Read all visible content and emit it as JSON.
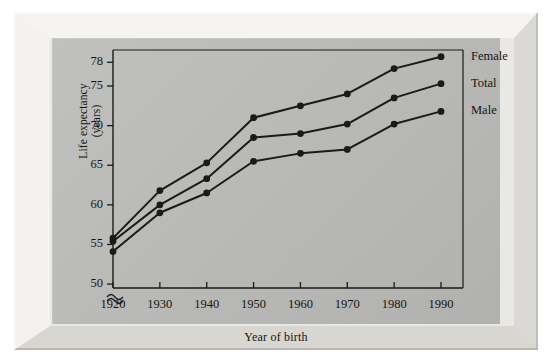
{
  "chart_data": {
    "type": "line",
    "title": "",
    "xlabel": "Year of birth",
    "ylabel": "Life expectancy (years)",
    "ylabel_line1": "Life expectancy",
    "ylabel_line2": "(years)",
    "x": [
      1920,
      1930,
      1940,
      1950,
      1960,
      1970,
      1980,
      1990
    ],
    "xtick_labels": [
      "1920",
      "1930",
      "1940",
      "1950",
      "1960",
      "1970",
      "1980",
      "1990"
    ],
    "ytick_labels": [
      "50",
      "55",
      "60",
      "65",
      "70",
      "75",
      "78"
    ],
    "yticks": [
      50,
      55,
      60,
      65,
      70,
      75,
      78
    ],
    "ylim": [
      49,
      79.8
    ],
    "xlim": [
      1918,
      1994
    ],
    "axis_break": true,
    "axis_break_symbol": "≈",
    "grid": false,
    "legend_position": "right",
    "marker": "filled-circle",
    "series": [
      {
        "name": "Female",
        "color": "#1c1a17",
        "values": [
          55.8,
          61.8,
          65.3,
          71.0,
          72.5,
          74.0,
          77.2,
          78.7
        ]
      },
      {
        "name": "Total",
        "color": "#1c1a17",
        "values": [
          55.4,
          60.0,
          63.3,
          68.5,
          69.0,
          70.2,
          73.5,
          75.3
        ]
      },
      {
        "name": "Male",
        "color": "#1c1a17",
        "values": [
          54.1,
          59.0,
          61.5,
          65.5,
          66.5,
          67.0,
          70.2,
          71.8
        ]
      }
    ]
  },
  "colors": {
    "panel": "#b9b9b7",
    "frame": "#e9e8e4",
    "ink": "#17140f"
  }
}
